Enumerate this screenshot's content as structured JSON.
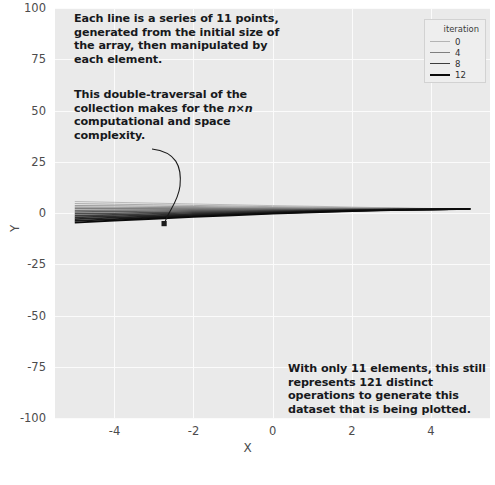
{
  "chart_data": {
    "type": "line",
    "title": "",
    "xlabel": "X",
    "ylabel": "Y",
    "xlim": [
      -5.5,
      5.5
    ],
    "ylim": [
      -100,
      100
    ],
    "xticks": [
      "-4",
      "-2",
      "0",
      "2",
      "4"
    ],
    "xtick_values": [
      -4,
      -2,
      0,
      2,
      4
    ],
    "yticks": [
      "100",
      "75",
      "50",
      "25",
      "0",
      "-25",
      "-50",
      "-75",
      "-100"
    ],
    "ytick_values": [
      100,
      75,
      50,
      25,
      0,
      -25,
      -50,
      -75,
      -100
    ],
    "grid": true,
    "legend_position": "upper right",
    "legend_title": "iteration",
    "x": [
      -5,
      -4,
      -3,
      -2,
      -1,
      0,
      1,
      2,
      3,
      4,
      5
    ],
    "series": [
      {
        "name": "0",
        "color": "#b4b4b4",
        "values": [
          5.6,
          5.2,
          4.8,
          4.4,
          4.0,
          3.6,
          3.3,
          2.9,
          2.5,
          2.2,
          1.9
        ]
      },
      {
        "name": "1",
        "color": "#a8a8a8",
        "values": [
          4.6,
          4.3,
          4.0,
          3.7,
          3.4,
          3.1,
          2.9,
          2.6,
          2.4,
          2.1,
          1.9
        ]
      },
      {
        "name": "2",
        "color": "#9c9c9c",
        "values": [
          3.7,
          3.5,
          3.3,
          3.1,
          2.9,
          2.7,
          2.6,
          2.4,
          2.3,
          2.1,
          2.0
        ]
      },
      {
        "name": "3",
        "color": "#8f8f8f",
        "values": [
          2.9,
          2.8,
          2.7,
          2.6,
          2.5,
          2.4,
          2.3,
          2.2,
          2.2,
          2.1,
          2.0
        ]
      },
      {
        "name": "4",
        "color": "#7f7f7f",
        "values": [
          2.1,
          2.1,
          2.1,
          2.1,
          2.1,
          2.1,
          2.1,
          2.0,
          2.0,
          2.0,
          2.0
        ]
      },
      {
        "name": "5",
        "color": "#6e6e6e",
        "values": [
          1.3,
          1.4,
          1.5,
          1.6,
          1.7,
          1.8,
          1.8,
          1.9,
          1.9,
          2.0,
          2.0
        ]
      },
      {
        "name": "6",
        "color": "#5e5e5e",
        "values": [
          0.5,
          0.7,
          0.9,
          1.1,
          1.3,
          1.5,
          1.6,
          1.8,
          1.9,
          1.9,
          2.0
        ]
      },
      {
        "name": "7",
        "color": "#4e4e4e",
        "values": [
          -0.4,
          -0.1,
          0.3,
          0.6,
          0.9,
          1.2,
          1.4,
          1.6,
          1.8,
          1.9,
          2.0
        ]
      },
      {
        "name": "8",
        "color": "#3d3d3d",
        "values": [
          -1.3,
          -0.9,
          -0.4,
          0.1,
          0.5,
          0.9,
          1.2,
          1.5,
          1.7,
          1.9,
          2.0
        ]
      },
      {
        "name": "9",
        "color": "#2f2f2f",
        "values": [
          -2.1,
          -1.6,
          -1.0,
          -0.4,
          0.1,
          0.6,
          1.0,
          1.4,
          1.6,
          1.8,
          2.0
        ]
      },
      {
        "name": "10",
        "color": "#232323",
        "values": [
          -3.0,
          -2.3,
          -1.6,
          -0.9,
          -0.3,
          0.3,
          0.8,
          1.2,
          1.6,
          1.8,
          2.0
        ]
      },
      {
        "name": "11",
        "color": "#171717",
        "values": [
          -3.8,
          -3.0,
          -2.2,
          -1.4,
          -0.7,
          0.0,
          0.6,
          1.1,
          1.5,
          1.8,
          2.0
        ]
      },
      {
        "name": "12",
        "color": "#0b0b0b",
        "values": [
          -4.7,
          -3.7,
          -2.8,
          -1.9,
          -1.1,
          -0.3,
          0.4,
          1.0,
          1.4,
          1.7,
          2.0
        ]
      }
    ]
  },
  "legend": {
    "title": "iteration",
    "entries": [
      {
        "label": "0",
        "color": "#b4b4b4",
        "width": 1.0
      },
      {
        "label": "4",
        "color": "#7f7f7f",
        "width": 1.4
      },
      {
        "label": "8",
        "color": "#3d3d3d",
        "width": 1.8
      },
      {
        "label": "12",
        "color": "#0b0b0b",
        "width": 2.2
      }
    ]
  },
  "annotations": {
    "top": "Each line is a series of 11 points, generated from the initial size of the array, then manipulated by each element.",
    "middle_part1": "This double-traversal of the collection makes for the ",
    "middle_math": "n×n",
    "middle_part2": " computational and space complexity.",
    "bottom": "With only 11 elements, this still represents 121 distinct operations to generate this dataset that is being plotted.",
    "arrow_name": "curved-arrow-to-lines"
  },
  "axes": {
    "xlabel": "X",
    "ylabel": "Y"
  }
}
